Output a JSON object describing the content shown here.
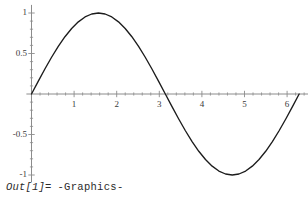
{
  "output": {
    "prompt_label": "Out[1]=",
    "value": "-Graphics-"
  },
  "chart_data": {
    "type": "line",
    "title": "",
    "xlabel": "",
    "ylabel": "",
    "function": "Sin[x]",
    "xlim": [
      -0.12,
      6.55
    ],
    "ylim": [
      -1.12,
      1.1
    ],
    "xticks": [
      0,
      1,
      2,
      3,
      4,
      5,
      6
    ],
    "xtick_labels": [
      "",
      "1",
      "2",
      "3",
      "4",
      "5",
      "6"
    ],
    "yticks": [
      -1,
      -0.5,
      0,
      0.5,
      1
    ],
    "ytick_labels": [
      "-1",
      "-0.5",
      "",
      "0.5",
      "1"
    ],
    "xminor_step": 0.2,
    "yminor_step": 0.1,
    "grid": false,
    "legend": null,
    "axis_color": "#8c8c8c",
    "curve_color": "#1c1c1c",
    "background": "#ffffff",
    "x": [
      0,
      0.1571,
      0.3142,
      0.4712,
      0.6283,
      0.7854,
      0.9425,
      1.0996,
      1.2566,
      1.4137,
      1.5708,
      1.7279,
      1.885,
      2.042,
      2.1991,
      2.3562,
      2.5133,
      2.6704,
      2.8274,
      2.9845,
      3.1416,
      3.2987,
      3.4558,
      3.6128,
      3.7699,
      3.927,
      4.0841,
      4.2412,
      4.3982,
      4.5553,
      4.7124,
      4.8695,
      5.0265,
      5.1836,
      5.3407,
      5.4978,
      5.6549,
      5.8119,
      5.969,
      6.1261,
      6.2832
    ],
    "y": [
      0,
      0.1564,
      0.309,
      0.454,
      0.5878,
      0.7071,
      0.809,
      0.891,
      0.9511,
      0.9877,
      1,
      0.9877,
      0.9511,
      0.891,
      0.809,
      0.7071,
      0.5878,
      0.454,
      0.309,
      0.1564,
      0,
      -0.1564,
      -0.309,
      -0.454,
      -0.5878,
      -0.7071,
      -0.809,
      -0.891,
      -0.9511,
      -0.9877,
      -1,
      -0.9877,
      -0.9511,
      -0.891,
      -0.809,
      -0.7071,
      -0.5878,
      -0.454,
      -0.309,
      -0.1564,
      0
    ]
  },
  "geometry": {
    "x_axis_y_px": 94,
    "y_axis_x_px": 31.5,
    "x_scale_px_per_unit": 42.6,
    "y_scale_px_per_unit": 81
  }
}
